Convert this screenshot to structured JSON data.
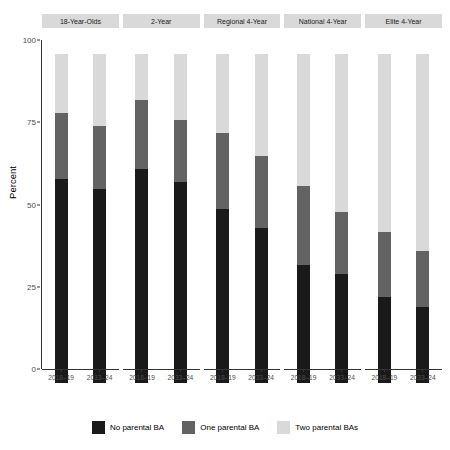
{
  "chart_data": {
    "type": "bar",
    "subtype": "stacked-percent",
    "title": "",
    "xlabel": "",
    "ylabel": "Percent",
    "ylim": [
      0,
      100
    ],
    "yticks": [
      0,
      25,
      50,
      75,
      100
    ],
    "ytick_labels": [
      "0",
      "25",
      "50",
      "75",
      "100"
    ],
    "grid": false,
    "legend_position": "bottom",
    "facet_labels": [
      "18-Year-Olds",
      "2-Year",
      "Regional 4-Year",
      "National 4-Year",
      "Elite 4-Year"
    ],
    "categories": [
      "2018–19",
      "2033–24"
    ],
    "series": [
      {
        "name": "No parental BA",
        "color": "#1a1a1a"
      },
      {
        "name": "One parental BA",
        "color": "#636363"
      },
      {
        "name": "Two parental BAs",
        "color": "#d9d9d9"
      }
    ],
    "panels": [
      {
        "facet": "18-Year-Olds",
        "bars": [
          {
            "category": "2018–19",
            "no_parental_ba": 62,
            "one_parental_ba": 20,
            "two_parental_bas": 18
          },
          {
            "category": "2033–24",
            "no_parental_ba": 59,
            "one_parental_ba": 19,
            "two_parental_bas": 22
          }
        ]
      },
      {
        "facet": "2-Year",
        "bars": [
          {
            "category": "2018–19",
            "no_parental_ba": 65,
            "one_parental_ba": 21,
            "two_parental_bas": 14
          },
          {
            "category": "2033–24",
            "no_parental_ba": 61,
            "one_parental_ba": 19,
            "two_parental_bas": 20
          }
        ]
      },
      {
        "facet": "Regional 4-Year",
        "bars": [
          {
            "category": "2018–19",
            "no_parental_ba": 53,
            "one_parental_ba": 23,
            "two_parental_bas": 24
          },
          {
            "category": "2033–24",
            "no_parental_ba": 47,
            "one_parental_ba": 22,
            "two_parental_bas": 31
          }
        ]
      },
      {
        "facet": "National 4-Year",
        "bars": [
          {
            "category": "2018–19",
            "no_parental_ba": 36,
            "one_parental_ba": 24,
            "two_parental_bas": 40
          },
          {
            "category": "2033–24",
            "no_parental_ba": 33,
            "one_parental_ba": 19,
            "two_parental_bas": 48
          }
        ]
      },
      {
        "facet": "Elite 4-Year",
        "bars": [
          {
            "category": "2018–19",
            "no_parental_ba": 26,
            "one_parental_ba": 20,
            "two_parental_bas": 54
          },
          {
            "category": "2033–24",
            "no_parental_ba": 23,
            "one_parental_ba": 17,
            "two_parental_bas": 60
          }
        ]
      }
    ]
  }
}
